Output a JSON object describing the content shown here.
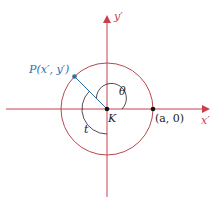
{
  "diagram": {
    "labels": {
      "y_axis": "y′",
      "x_axis": "x′",
      "point_p": "P(x′, y′)",
      "center": "K",
      "point_a": "(a, 0)",
      "theta": "θ",
      "t": "t"
    },
    "colors": {
      "axis": "#c8404e",
      "circle": "#b84850",
      "point_p": "#2a6fa8",
      "text": "#222222",
      "arc": "#222222"
    }
  }
}
